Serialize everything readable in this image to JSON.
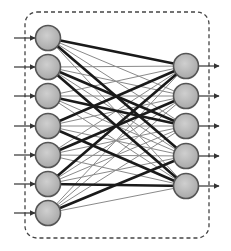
{
  "diagram": {
    "type": "neural-network",
    "title": "",
    "colors": {
      "node_fill": "#bdbdbd",
      "node_stroke": "#555555",
      "thin_edge": "#8a8a8a",
      "thick_edge": "#1a1a1a",
      "border": "#444444",
      "arrow": "#333333"
    },
    "border": {
      "x": 25,
      "y": 12,
      "width": 184,
      "height": 226,
      "radius": 12,
      "style": "dashed"
    },
    "input_layer": {
      "x": 48,
      "radius": 12.5,
      "nodes": [
        38,
        67,
        96,
        126,
        155,
        184,
        213
      ]
    },
    "output_layer": {
      "x": 186,
      "radius": 12.5,
      "nodes": [
        66,
        96,
        126,
        156,
        186
      ]
    },
    "input_arrows": {
      "from_x": 14,
      "to_x": 35
    },
    "output_arrows": {
      "from_x": 199,
      "to_x": 219
    },
    "thick_edges": [
      [
        0,
        0
      ],
      [
        0,
        3
      ],
      [
        1,
        4
      ],
      [
        1,
        2
      ],
      [
        3,
        0
      ],
      [
        3,
        4
      ],
      [
        4,
        1
      ],
      [
        5,
        0
      ],
      [
        5,
        4
      ],
      [
        6,
        3
      ],
      [
        2,
        2
      ]
    ]
  }
}
